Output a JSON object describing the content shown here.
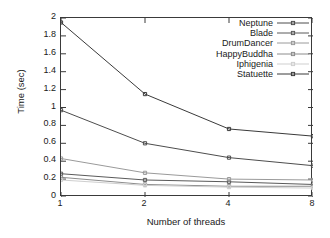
{
  "chart_data": {
    "type": "line",
    "title": "",
    "xlabel": "Number of threads",
    "ylabel": "Time (sec)",
    "x": [
      1,
      2,
      4,
      8
    ],
    "xticklabels": [
      "1",
      "2",
      "4",
      "8"
    ],
    "xscale": "log2",
    "xlim": [
      1,
      8
    ],
    "ylim": [
      0,
      2
    ],
    "yticks": [
      0,
      0.2,
      0.4,
      0.6,
      0.8,
      1,
      1.2,
      1.4,
      1.6,
      1.8,
      2
    ],
    "yticklabels": [
      "0",
      "0.2",
      "0.4",
      "0.6",
      "0.8",
      "1",
      "1.2",
      "1.4",
      "1.6",
      "1.8",
      "2"
    ],
    "grid": false,
    "legend_position": "top-right-inside",
    "series": [
      {
        "name": "Neptune",
        "values": [
          0.97,
          0.6,
          0.44,
          0.35
        ],
        "color": "#4d4d4d"
      },
      {
        "name": "Blade",
        "values": [
          0.26,
          0.19,
          0.17,
          0.14
        ],
        "color": "#5a5a5a"
      },
      {
        "name": "DrumDancer",
        "values": [
          0.43,
          0.27,
          0.2,
          0.19
        ],
        "color": "#9a9a9a"
      },
      {
        "name": "HappyBuddha",
        "values": [
          0.22,
          0.14,
          0.12,
          0.12
        ],
        "color": "#8c8c8c"
      },
      {
        "name": "Iphigenia",
        "values": [
          0.19,
          0.13,
          0.11,
          0.1
        ],
        "color": "#cfcfcf"
      },
      {
        "name": "Statuette",
        "values": [
          1.95,
          1.15,
          0.76,
          0.68
        ],
        "color": "#3a3a3a"
      }
    ]
  },
  "axes": {
    "ylabel": "Time (sec)",
    "xlabel": "Number of threads",
    "yticklabels": [
      "2",
      "1.8",
      "1.6",
      "1.4",
      "1.2",
      "1",
      "0.8",
      "0.6",
      "0.4",
      "0.2",
      "0"
    ],
    "xticklabels": [
      "1",
      "2",
      "4",
      "8"
    ]
  },
  "legend": {
    "items": [
      {
        "label": "Neptune"
      },
      {
        "label": "Blade"
      },
      {
        "label": "DrumDancer"
      },
      {
        "label": "HappyBuddha"
      },
      {
        "label": "Iphigenia"
      },
      {
        "label": "Statuette"
      }
    ]
  }
}
